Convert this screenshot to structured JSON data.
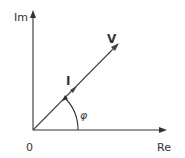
{
  "diagram": {
    "type": "phasor-diagram",
    "axes": {
      "vertical_label": "Im",
      "horizontal_label": "Re",
      "origin_label": "0"
    },
    "vectors": [
      {
        "label": "V",
        "description": "voltage phasor"
      },
      {
        "label": "I",
        "description": "current phasor"
      }
    ],
    "angle": {
      "label": "φ"
    },
    "colors": {
      "stroke": "#333333",
      "background": "#ffffff"
    }
  }
}
